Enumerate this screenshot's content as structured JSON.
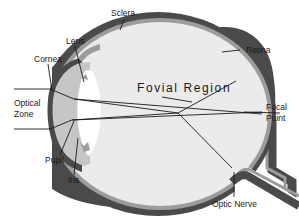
{
  "diagram": {
    "type": "anatomical-eye-cross-section",
    "colors": {
      "background": "#ffffff",
      "sclera": "#4a4a4a",
      "retina": "#9c9c9c",
      "vitreous": "#ebebeb",
      "anterior_chamber": "#c6c6c6",
      "lens": "#ffffff",
      "lines": "#1a1a1a"
    },
    "region_title": "Fovial Region",
    "labels": {
      "sclera": "Sclera",
      "lens": "Lens",
      "cornea": "Cornea",
      "retina": "Retina",
      "optical_zone_line1": "Optical",
      "optical_zone_line2": "Zone",
      "focal_point_line1": "Focal",
      "focal_point_line2": "Point",
      "pupil": "Pupil",
      "iris": "Iris",
      "optic_nerve": "Optic Nerve"
    }
  }
}
